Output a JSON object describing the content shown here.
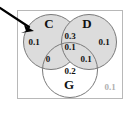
{
  "figure": {
    "type": "venn-diagram",
    "set_count": 3,
    "universe_outside_value": "0.1",
    "sets": [
      {
        "key": "C",
        "label": "C",
        "shaded": true,
        "fill": "#dcdcdc"
      },
      {
        "key": "D",
        "label": "D",
        "shaded": true,
        "fill": "#dcdcdc"
      },
      {
        "key": "G",
        "label": "G",
        "shaded": false,
        "fill": "#ffffff"
      }
    ],
    "regions": [
      {
        "key": "C_only",
        "label": "C only",
        "value": "0.1"
      },
      {
        "key": "D_only",
        "label": "D only",
        "value": "0.1"
      },
      {
        "key": "C_and_D",
        "label": "C and D only",
        "value": "0.3"
      },
      {
        "key": "C_D_G",
        "label": "C and D and G",
        "value": "0.1"
      },
      {
        "key": "C_and_G",
        "label": "C and G only",
        "value": "0"
      },
      {
        "key": "D_and_G",
        "label": "D and G only",
        "value": "0.1"
      },
      {
        "key": "G_only",
        "label": "G only",
        "value": "0.2"
      },
      {
        "key": "outside",
        "label": "outside all sets",
        "value": "0.1"
      }
    ],
    "annotation": {
      "arrow_label": "pointer-arrow",
      "arrow_color": "#000000",
      "points_to": "C_only"
    },
    "colors": {
      "circle_stroke": "#7a7a7a",
      "circle_fill_shaded": "#dcdcdc",
      "box_stroke": "#b8b8b8",
      "text": "#111111",
      "text_muted": "#b0b0b0",
      "background": "#ffffff"
    }
  }
}
